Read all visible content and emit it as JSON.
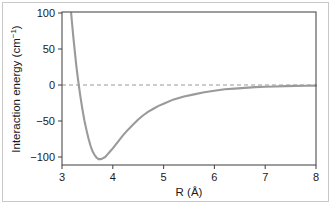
{
  "figure": {
    "background_color": "#ffffff",
    "frame_color": "#4d4d4d",
    "curve_color": "#9a9a9a",
    "zero_line_color": "#9a9a9a",
    "border_color": "#c8c8c8"
  },
  "labels": {
    "y_axis_title_main": "Interaction energy (cm",
    "y_axis_title_sup": "−1",
    "y_axis_title_close": ")",
    "y_axis_title_full": "Interaction energy (cm⁻¹)",
    "x_axis_title": "R (Å)"
  },
  "ticks": {
    "y": [
      "100",
      "50",
      "0",
      "−50",
      "−100"
    ],
    "x": [
      "3",
      "4",
      "5",
      "6",
      "7",
      "8"
    ]
  },
  "chart_data": {
    "type": "line",
    "title": "",
    "xlabel": "R (Å)",
    "ylabel": "Interaction energy (cm⁻¹)",
    "xlim": [
      3,
      8
    ],
    "ylim": [
      -115,
      100
    ],
    "xticks": [
      3,
      4,
      5,
      6,
      7,
      8
    ],
    "yticks": [
      100,
      50,
      0,
      -50,
      -100
    ],
    "grid": false,
    "legend": null,
    "annotations": [
      {
        "name": "zero-reference-line",
        "type": "hline",
        "y": 0,
        "style": "dashed",
        "color": "#9a9a9a"
      }
    ],
    "series": [
      {
        "name": "interaction potential",
        "color": "#9a9a9a",
        "style": "solid",
        "width": 2.0,
        "well_depth": -103,
        "equilibrium_distance": 3.72,
        "zero_crossing": 3.28,
        "x": [
          3.18,
          3.2,
          3.22,
          3.24,
          3.26,
          3.28,
          3.3,
          3.33,
          3.36,
          3.4,
          3.44,
          3.48,
          3.52,
          3.56,
          3.6,
          3.64,
          3.68,
          3.72,
          3.76,
          3.8,
          3.85,
          3.9,
          3.95,
          4.0,
          4.1,
          4.2,
          4.3,
          4.4,
          4.5,
          4.6,
          4.7,
          4.8,
          4.9,
          5.0,
          5.2,
          5.4,
          5.6,
          5.8,
          6.0,
          6.2,
          6.4,
          6.6,
          6.8,
          7.0,
          7.2,
          7.4,
          7.6,
          7.8,
          8.0
        ],
        "y": [
          100,
          84,
          69,
          55,
          41,
          28,
          16,
          0,
          -15,
          -33,
          -49,
          -62,
          -74,
          -84,
          -92,
          -97,
          -101,
          -103,
          -103,
          -102,
          -100,
          -96,
          -92,
          -88,
          -79,
          -70,
          -62,
          -55,
          -48,
          -42,
          -37,
          -33,
          -29,
          -26,
          -20,
          -16,
          -13,
          -10,
          -8,
          -6,
          -5,
          -4,
          -3,
          -2.5,
          -2,
          -1.5,
          -1.2,
          -1,
          -0.8
        ]
      }
    ]
  }
}
